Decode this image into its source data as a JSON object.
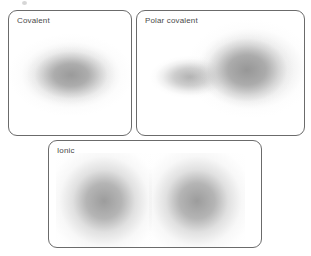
{
  "figure": {
    "background_color": "#ffffff",
    "width": 311,
    "height": 256
  },
  "panels": [
    {
      "id": "covalent",
      "label": "Covalent",
      "border_color": "#6b6b6b",
      "cloud_color": "#969696",
      "clouds": [
        {
          "name": "shared-electron-cloud",
          "shape": "ellipse",
          "center_x": 0.5,
          "center_y": 0.5,
          "symmetry": "symmetric"
        }
      ]
    },
    {
      "id": "polar-covalent",
      "label": "Polar covalent",
      "border_color": "#6b6b6b",
      "cloud_color": "#949494",
      "clouds": [
        {
          "name": "shared-electron-cloud-dense-lobe",
          "shape": "ellipse",
          "center_x": 0.64,
          "center_y": 0.46,
          "symmetry": "asymmetric"
        },
        {
          "name": "shared-electron-cloud-tail-lobe",
          "shape": "ellipse",
          "center_x": 0.36,
          "center_y": 0.52,
          "symmetry": "asymmetric"
        }
      ]
    },
    {
      "id": "ionic",
      "label": "Ionic",
      "border_color": "#6b6b6b",
      "cloud_color": "#969696",
      "clouds": [
        {
          "name": "anion-electron-cloud",
          "shape": "circle",
          "center_x": 0.26,
          "center_y": 0.56,
          "symmetry": "separate"
        },
        {
          "name": "cation-electron-cloud",
          "shape": "circle",
          "center_x": 0.69,
          "center_y": 0.56,
          "symmetry": "separate"
        }
      ]
    }
  ]
}
